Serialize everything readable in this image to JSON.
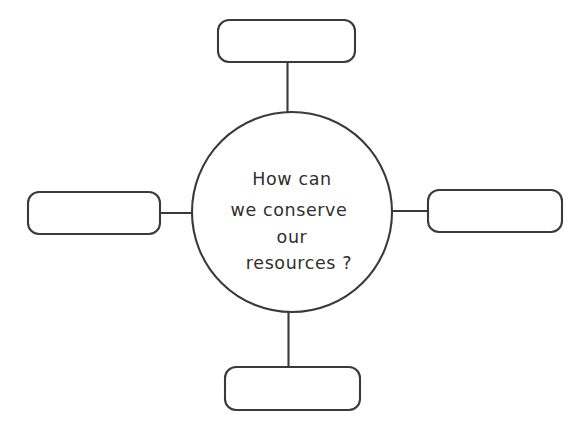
{
  "document": {
    "title": "Concept Map Worksheet",
    "background_color": "#ffffff",
    "stroke_color": "#3a3a3a",
    "text_color": "#2f2f2f"
  },
  "center_node": {
    "name": "central-question",
    "shape": "circle",
    "lines": [
      "How  can",
      "we  conserve",
      "our",
      "resources ?"
    ],
    "full_text": "How can we conserve our resources?"
  },
  "branches": [
    {
      "position": "top",
      "label": "",
      "placeholder": ""
    },
    {
      "position": "left",
      "label": "",
      "placeholder": ""
    },
    {
      "position": "right",
      "label": "",
      "placeholder": ""
    },
    {
      "position": "bottom",
      "label": "",
      "placeholder": ""
    }
  ]
}
